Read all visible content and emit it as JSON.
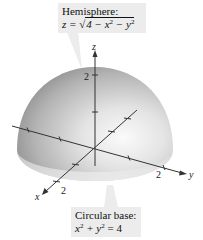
{
  "top_callout": {
    "title": "Hemisphere:",
    "equation_lhs": "z =",
    "equation_radicand": "4 − x² − y²",
    "equation_parts": [
      "4 − x",
      "2",
      " − y",
      "2"
    ]
  },
  "bottom_callout": {
    "title": "Circular base:",
    "equation_parts": [
      "x",
      "2",
      " + y",
      "2",
      " = 4"
    ]
  },
  "axes": {
    "x_label": "x",
    "y_label": "y",
    "z_label": "z",
    "x_tick_label": "2",
    "y_tick_label": "2",
    "z_tick_label": "2"
  },
  "colors": {
    "surface_dark": "#8a8a8a",
    "surface_light": "#f2f2f2",
    "callout_bg": "#ececec",
    "axis": "#333333"
  }
}
